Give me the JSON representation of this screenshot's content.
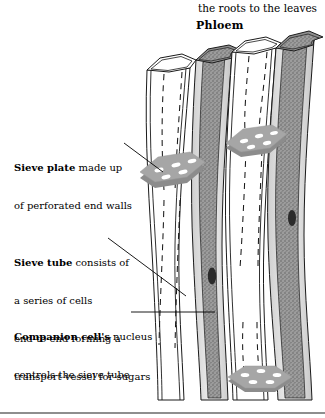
{
  "page": {
    "running_head": "the roots to the leaves",
    "figure_title": "Phloem",
    "background_color": "#ffffff",
    "text_color": "#000000"
  },
  "figure": {
    "title": "Phloem",
    "colors": {
      "cell_wall_line": "#1a1a1a",
      "wall_fill": "#d0d0d0",
      "sieve_tube_lumen": "#ffffff",
      "companion_cell_fill": "#9a9a9a",
      "companion_cell_stipple": "#6b6b6b",
      "nucleus": "#2b2b2b",
      "sieve_plate_top": "#a6a6a6",
      "sieve_plate_side": "#8c8c8c",
      "sieve_pore": "#ffffff",
      "dashed_flow_line": "#1a1a1a",
      "leader_line": "#000000",
      "bottom_rule": "#8e8e8e"
    },
    "structures": [
      {
        "name": "sieve-tube",
        "count": 2,
        "appearance": "white hollow tube with hexagonal open top"
      },
      {
        "name": "companion-cell",
        "count": 2,
        "appearance": "dark stippled grey elongated cell with nucleus"
      },
      {
        "name": "sieve-plate",
        "count": 3,
        "appearance": "grey hexagonal slab with white oval perforations"
      },
      {
        "name": "nucleus",
        "count": 2,
        "appearance": "small dark oval inside companion cell"
      },
      {
        "name": "flow-line",
        "count": 6,
        "appearance": "vertical dashed line showing sugar transport"
      }
    ]
  },
  "callouts": [
    {
      "id": "sieve-plate",
      "bold_lead": "Sieve plate",
      "rest_first_line": " made up",
      "lines": [
        "of perforated end walls"
      ],
      "full_text": "Sieve plate made up of perforated end walls",
      "leader": "straight line to middle sieve plate"
    },
    {
      "id": "sieve-tube",
      "bold_lead": "Sieve tube",
      "rest_first_line": " consists of",
      "lines": [
        "a series of cells",
        "end-to-end forming a",
        "transport vessel for sugars"
      ],
      "full_text": "Sieve tube consists of a series of cells end-to-end forming a transport vessel for sugars",
      "leader": "diagonal line down-right to sieve tube wall"
    },
    {
      "id": "companion-cell",
      "bold_lead": "Companion cell's",
      "rest_first_line": " nucleus",
      "lines": [
        "controls the sieve tube"
      ],
      "full_text": "Companion cell's nucleus controls the sieve tube",
      "leader": "horizontal line right to companion cell"
    }
  ]
}
